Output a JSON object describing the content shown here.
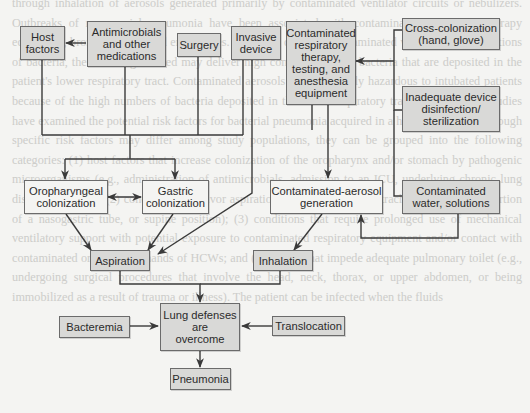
{
  "background_text": "through inhalation of aerosols generated primarily by contaminated ventilator circuits or nebulizers. Outbreaks of nosocomial pneumonia have been associated with contaminated respiratory therapy equipment, bronchoscopes, and endoscopes. When the device is contaminated with high concentrations of bacteria, the aerosol generated may deliver high concentrations of bacteria that are deposited in the patient's lower respiratory tract. Contaminated aerosols are particularly hazardous to intubated patients because of the high numbers of bacteria deposited in the lower respiratory tract. Several large studies have examined the potential risk factors for bacterial pneumonia acquired in a hospital setting. Although specific risk factors may differ among study populations, they can be grouped into the following categories: (1) host factors that increase colonization of the oropharynx and/or stomach by pathogenic microorganisms (e.g., administration of antimicrobials, admission to an ICU, underlying chronic lung disease, or coma); (2) conditions that favor aspiration or reflux (e.g., endotracheal intubation, insertion of a nasogastric tube, or supine position); (3) conditions that require prolonged use of mechanical ventilatory support with potential exposure to contaminated respiratory equipment and/or contact with contaminated or colonized hands of HCWs; and (4) factors that impede adequate pulmonary toilet (e.g., undergoing surgical procedures that involve the head, neck, thorax, or upper abdomen, or being immobilized as a result of trauma or illness). The patient can be infected when the fluids",
  "diagram": {
    "nodes": {
      "host_factors": "Host\nfactors",
      "antimicrobials": "Antimicrobials\nand other\nmedications",
      "surgery": "Surgery",
      "invasive_device": "Invasive\ndevice",
      "contaminated_equipment": "Contaminated\nrespiratory\ntherapy,\ntesting, and\nanesthesia\nequipment",
      "cross_colonization": "Cross-colonization\n(hand, glove)",
      "inadequate_disinfection": "Inadequate device\ndisinfection/\nsterilization",
      "oropharyngeal_colonization": "Oropharyngeal\ncolonization",
      "gastric_colonization": "Gastric\ncolonization",
      "contaminated_aerosol": "Contaminated-aerosol\ngeneration",
      "contaminated_water": "Contaminated\nwater, solutions",
      "aspiration": "Aspiration",
      "inhalation": "Inhalation",
      "bacteremia": "Bacteremia",
      "lung_defenses": "Lung defenses\nare\novercome",
      "translocation": "Translocation",
      "pneumonia": "Pneumonia"
    },
    "edges": [
      {
        "from": "antimicrobials",
        "to": "host_factors"
      },
      {
        "from": "host_factors",
        "to": "oropharyngeal_colonization"
      },
      {
        "from": "antimicrobials",
        "to": "oropharyngeal_colonization"
      },
      {
        "from": "surgery",
        "to": "gastric_colonization"
      },
      {
        "from": "invasive_device",
        "to": "gastric_colonization"
      },
      {
        "from": "invasive_device",
        "to": "aspiration"
      },
      {
        "from": "oropharyngeal_colonization",
        "to": "gastric_colonization",
        "bidirectional": true
      },
      {
        "from": "cross_colonization",
        "to": "contaminated_equipment"
      },
      {
        "from": "inadequate_disinfection",
        "to": "contaminated_equipment"
      },
      {
        "from": "contaminated_equipment",
        "to": "contaminated_aerosol"
      },
      {
        "from": "contaminated_water",
        "to": "contaminated_aerosol"
      },
      {
        "from": "oropharyngeal_colonization",
        "to": "aspiration"
      },
      {
        "from": "gastric_colonization",
        "to": "aspiration"
      },
      {
        "from": "contaminated_aerosol",
        "to": "inhalation"
      },
      {
        "from": "aspiration",
        "to": "lung_defenses"
      },
      {
        "from": "inhalation",
        "to": "lung_defenses"
      },
      {
        "from": "bacteremia",
        "to": "lung_defenses"
      },
      {
        "from": "translocation",
        "to": "lung_defenses"
      },
      {
        "from": "lung_defenses",
        "to": "pneumonia"
      }
    ]
  }
}
